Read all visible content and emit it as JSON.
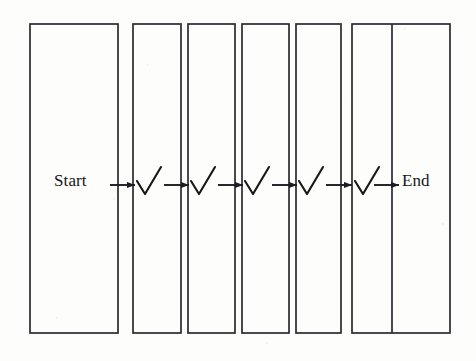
{
  "figure": {
    "type": "process-flow-diagram",
    "orientation": "horizontal",
    "background_color": "#fdfdfc",
    "stroke_color": "#2b2b2f",
    "text_color": "#17171a",
    "labels": {
      "start": "Start",
      "end": "End"
    },
    "boxes": [
      {
        "id": "box-1",
        "x": 30,
        "y": 24,
        "width": 88,
        "height": 309,
        "divider_x": null
      },
      {
        "id": "box-2",
        "x": 133,
        "y": 24,
        "width": 48,
        "height": 309,
        "divider_x": null
      },
      {
        "id": "box-3",
        "x": 188,
        "y": 24,
        "width": 47,
        "height": 309,
        "divider_x": null
      },
      {
        "id": "box-4",
        "x": 242,
        "y": 24,
        "width": 47,
        "height": 309,
        "divider_x": null
      },
      {
        "id": "box-5",
        "x": 296,
        "y": 24,
        "width": 45,
        "height": 309,
        "divider_x": null
      },
      {
        "id": "box-6",
        "x": 352,
        "y": 24,
        "width": 98,
        "height": 309,
        "divider_x": 392
      }
    ],
    "checkmarks": [
      {
        "id": "check-1",
        "x": 143,
        "y": 185
      },
      {
        "id": "check-2",
        "x": 197,
        "y": 185
      },
      {
        "id": "check-3",
        "x": 251,
        "y": 185
      },
      {
        "id": "check-4",
        "x": 305,
        "y": 185
      },
      {
        "id": "check-5",
        "x": 361,
        "y": 185
      }
    ],
    "arrows": [
      {
        "id": "arrow-1",
        "x1": 110,
        "x2": 136,
        "y": 185
      },
      {
        "id": "arrow-2",
        "x1": 164,
        "x2": 190,
        "y": 185
      },
      {
        "id": "arrow-3",
        "x1": 218,
        "x2": 244,
        "y": 185
      },
      {
        "id": "arrow-4",
        "x1": 272,
        "x2": 298,
        "y": 185
      },
      {
        "id": "arrow-5",
        "x1": 326,
        "x2": 353,
        "y": 185
      },
      {
        "id": "arrow-6",
        "x1": 374,
        "x2": 400,
        "y": 185
      }
    ],
    "flow_sequence": [
      "Start",
      "✓",
      "✓",
      "✓",
      "✓",
      "✓",
      "End"
    ],
    "checkmark_count": 5
  }
}
